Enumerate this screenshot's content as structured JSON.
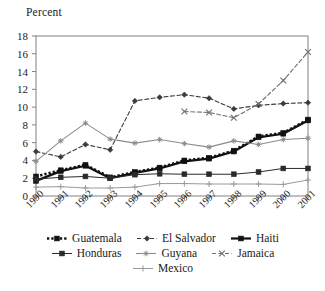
{
  "chart_data": {
    "type": "line",
    "title": "",
    "ylabel": "Percent",
    "xlabel": "",
    "ylim": [
      0,
      18
    ],
    "yticks": [
      0,
      2,
      4,
      6,
      8,
      10,
      12,
      14,
      16,
      18
    ],
    "grid": false,
    "legend_position": "bottom",
    "x": [
      "1990",
      "1991",
      "1992",
      "1993",
      "1994",
      "1995",
      "1996",
      "1997",
      "1998",
      "1999",
      "2000",
      "2001"
    ],
    "categories": [
      "1990",
      "1991",
      "1992",
      "1993",
      "1994",
      "1995",
      "1996",
      "1997",
      "1998",
      "1999",
      "2000",
      "2001"
    ],
    "series": [
      {
        "name": "Guatemala",
        "color": "#111111",
        "marker": "square",
        "dash": "dotted",
        "width": 2.6,
        "values": [
          2.2,
          2.9,
          3.5,
          2.1,
          2.7,
          3.2,
          4.0,
          4.3,
          5.1,
          6.7,
          7.1,
          8.6
        ]
      },
      {
        "name": "El Salvador",
        "color": "#3b3b3b",
        "marker": "diamond",
        "dash": "dashed",
        "width": 1.1,
        "values": [
          5.0,
          4.4,
          5.8,
          5.2,
          10.7,
          11.1,
          11.4,
          11.0,
          9.8,
          10.2,
          10.4,
          10.5
        ]
      },
      {
        "name": "Haiti",
        "color": "#111111",
        "marker": "square",
        "dash": "solid",
        "width": 2.2,
        "values": [
          1.7,
          2.8,
          3.4,
          2.0,
          2.6,
          3.1,
          3.9,
          4.2,
          5.0,
          6.6,
          7.0,
          8.5
        ]
      },
      {
        "name": "Honduras",
        "color": "#2a2a2a",
        "marker": "square",
        "dash": "solid",
        "width": 1.0,
        "values": [
          1.9,
          2.1,
          2.2,
          2.0,
          2.4,
          2.5,
          2.45,
          2.45,
          2.45,
          2.7,
          3.1,
          3.1
        ]
      },
      {
        "name": "Guyana",
        "color": "#8c8c8c",
        "marker": "star",
        "dash": "solid",
        "width": 1.1,
        "values": [
          3.9,
          6.2,
          8.2,
          6.4,
          5.95,
          6.35,
          5.9,
          5.5,
          6.2,
          5.8,
          6.35,
          6.5
        ]
      },
      {
        "name": "Jamaica",
        "color": "#6e6e6e",
        "marker": "x",
        "dash": "dashed",
        "width": 1.1,
        "values": [
          null,
          null,
          null,
          null,
          null,
          null,
          9.5,
          9.4,
          8.8,
          10.35,
          13.0,
          16.2
        ]
      },
      {
        "name": "Mexico",
        "color": "#9a9a9a",
        "marker": "plus",
        "dash": "solid",
        "width": 1.0,
        "values": [
          1.0,
          1.05,
          0.9,
          0.9,
          1.0,
          1.4,
          1.4,
          1.35,
          1.35,
          1.35,
          1.3,
          1.8
        ]
      }
    ]
  },
  "legend": {
    "rows": [
      [
        "Guatemala",
        "El Salvador",
        "Haiti"
      ],
      [
        "Honduras",
        "Guyana",
        "Jamaica"
      ],
      [
        "Mexico"
      ]
    ]
  },
  "axis": {
    "frame_color": "#808080"
  }
}
